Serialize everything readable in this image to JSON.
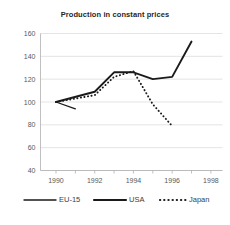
{
  "chart_data": {
    "type": "line",
    "title": "Production in constant prices",
    "xlabel": "",
    "ylabel": "",
    "xlim": [
      1989.2,
      1998.6
    ],
    "ylim": [
      40,
      160
    ],
    "yticks": [
      40,
      60,
      80,
      100,
      120,
      140,
      160
    ],
    "xticks": [
      1990,
      1991,
      1992,
      1993,
      1994,
      1995,
      1996,
      1997,
      1998
    ],
    "xticklabels": [
      "1990",
      "",
      "1992",
      "",
      "1994",
      "",
      "1996",
      "",
      "1998"
    ],
    "grid": true,
    "legend_position": "bottom",
    "series": [
      {
        "name": "EU-15",
        "style": "solid-thin",
        "x": [
          1990,
          1991
        ],
        "values": [
          100,
          94
        ]
      },
      {
        "name": "USA",
        "style": "solid-thick",
        "x": [
          1990,
          1992,
          1993,
          1994,
          1995,
          1996,
          1997
        ],
        "values": [
          100,
          109,
          126,
          126,
          120,
          122,
          153
        ]
      },
      {
        "name": "Japan",
        "style": "dotted",
        "x": [
          1990,
          1992,
          1993,
          1994,
          1995,
          1996
        ],
        "values": [
          100,
          106,
          122,
          127,
          98,
          79
        ]
      }
    ]
  },
  "legend": {
    "items": [
      {
        "label": "EU-15"
      },
      {
        "label": "USA"
      },
      {
        "label": "Japan"
      }
    ]
  },
  "colors": {
    "line": "#1a1a1a",
    "grid": "#d9d9d9",
    "axis": "#b0b0b0",
    "text": "#404040",
    "title": "#262626",
    "background": "#ffffff"
  }
}
